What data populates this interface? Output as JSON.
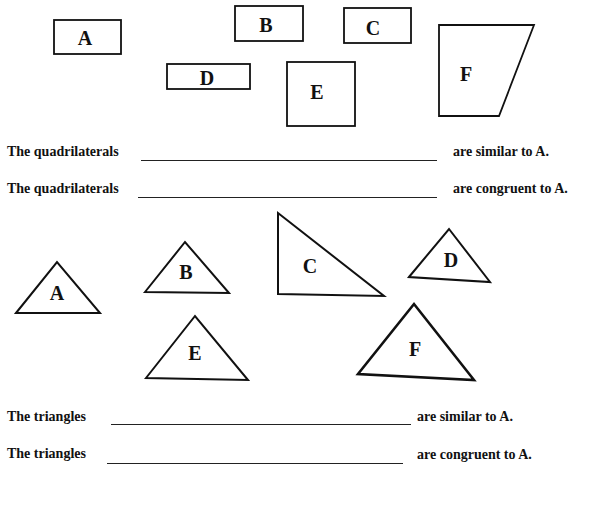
{
  "quadrilaterals": [
    {
      "label": "A",
      "type": "rect",
      "x": 54,
      "y": 20,
      "w": 67,
      "h": 34
    },
    {
      "label": "B",
      "type": "rect",
      "x": 235,
      "y": 6,
      "w": 68,
      "h": 35
    },
    {
      "label": "C",
      "type": "rect",
      "x": 344,
      "y": 8,
      "w": 67,
      "h": 35
    },
    {
      "label": "D",
      "type": "rect",
      "x": 167,
      "y": 64,
      "w": 83,
      "h": 25
    },
    {
      "label": "E",
      "type": "rect",
      "x": 287,
      "y": 62,
      "w": 68,
      "h": 64
    },
    {
      "label": "F",
      "type": "polygon",
      "points": "439,25 534,25 499,116 439,116"
    }
  ],
  "triangles": [
    {
      "label": "A",
      "points": "16,313 57,262 100,313"
    },
    {
      "label": "B",
      "points": "145,292 185,242 229,293"
    },
    {
      "label": "C",
      "points": "278,213 278,294 384,296"
    },
    {
      "label": "D",
      "points": "409,277 449,229 490,282"
    },
    {
      "label": "E",
      "points": "146,378 195,316 248,380"
    },
    {
      "label": "F",
      "points": "358,374 414,304 474,380"
    }
  ],
  "questions": {
    "quad_similar": {
      "prefix": "The quadrilaterals",
      "suffix": "are similar to A.",
      "answer": ""
    },
    "quad_congruent": {
      "prefix": "The quadrilaterals",
      "suffix": "are congruent to A.",
      "answer": ""
    },
    "tri_similar": {
      "prefix": "The triangles",
      "suffix": "are similar to A.",
      "answer": ""
    },
    "tri_congruent": {
      "prefix": "The triangles",
      "suffix": "are congruent to A.",
      "answer": ""
    }
  },
  "labels": {
    "quad": {
      "A": "A",
      "B": "B",
      "C": "C",
      "D": "D",
      "E": "E",
      "F": "F"
    },
    "tri": {
      "A": "A",
      "B": "B",
      "C": "C",
      "D": "D",
      "E": "E",
      "F": "F"
    }
  }
}
